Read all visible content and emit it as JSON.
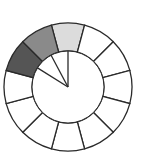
{
  "diagram": {
    "type": "segmented-ring",
    "center": [
      68,
      87
    ],
    "outer_radius": 64,
    "inner_radius": 36,
    "segment_count": 12,
    "segment_start_angle_deg": -15,
    "segment_span_deg": 30,
    "stroke_color": "#2a2a2a",
    "default_fill": "#ffffff",
    "segments": [
      {
        "index": 0,
        "fill": "#dcdcdc",
        "label": "light"
      },
      {
        "index": 1,
        "fill": "#ffffff"
      },
      {
        "index": 2,
        "fill": "#ffffff"
      },
      {
        "index": 3,
        "fill": "#ffffff"
      },
      {
        "index": 4,
        "fill": "#ffffff"
      },
      {
        "index": 5,
        "fill": "#ffffff"
      },
      {
        "index": 6,
        "fill": "#ffffff"
      },
      {
        "index": 7,
        "fill": "#ffffff"
      },
      {
        "index": 8,
        "fill": "#ffffff"
      },
      {
        "index": 9,
        "fill": "#ffffff"
      },
      {
        "index": 10,
        "fill": "#555555",
        "label": "dark"
      },
      {
        "index": 11,
        "fill": "#8a8a8a",
        "label": "medium"
      }
    ],
    "pointer_lines_deg": [
      0,
      -28,
      -58
    ]
  }
}
